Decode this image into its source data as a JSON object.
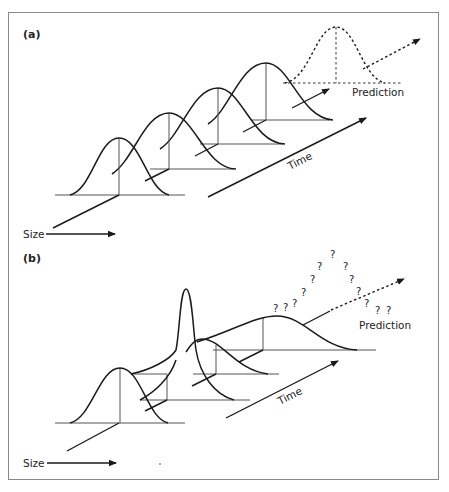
{
  "figure": {
    "border_color": "#8a8a8a",
    "line_color": "#1a1a1a"
  },
  "panel_a": {
    "label": "(a)",
    "size_axis_label": "Size",
    "time_axis_label": "Time",
    "prediction_label": "Prediction",
    "distributions": [
      {
        "name": "t1",
        "style": "solid"
      },
      {
        "name": "t2",
        "style": "solid"
      },
      {
        "name": "t3",
        "style": "solid"
      },
      {
        "name": "t4",
        "style": "solid"
      },
      {
        "name": "predicted",
        "style": "dotted"
      }
    ]
  },
  "panel_b": {
    "label": "(b)",
    "size_axis_label": "Size",
    "time_axis_label": "Time",
    "prediction_label": "Prediction",
    "uncertainty_marks": [
      "?",
      "?",
      "?",
      "?",
      "?",
      "?",
      "?",
      "?",
      "?",
      "?",
      "?",
      "?",
      "?"
    ],
    "distributions": [
      {
        "name": "t1",
        "style": "solid",
        "shape": "normal"
      },
      {
        "name": "t2",
        "style": "solid",
        "shape": "narrow-spike"
      },
      {
        "name": "t3",
        "style": "solid",
        "shape": "skewed"
      },
      {
        "name": "t4",
        "style": "solid",
        "shape": "wide"
      }
    ]
  }
}
